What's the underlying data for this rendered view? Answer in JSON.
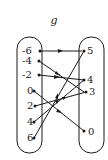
{
  "diagram": {
    "title": "g",
    "domain": [
      "-6",
      "-4",
      "-2",
      "0",
      "2",
      "4",
      "6"
    ],
    "range": [
      "5",
      "4",
      "3",
      "0"
    ],
    "mapping": [
      {
        "from": "-6",
        "to": "5"
      },
      {
        "from": "-4",
        "to": "3"
      },
      {
        "from": "-2",
        "to": "4"
      },
      {
        "from": "0",
        "to": "0"
      },
      {
        "from": "2",
        "to": "3"
      },
      {
        "from": "4",
        "to": "4"
      },
      {
        "from": "6",
        "to": "5"
      }
    ],
    "line_color": "#1a1a1a"
  }
}
